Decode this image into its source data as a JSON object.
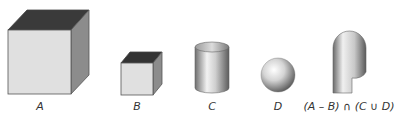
{
  "diagram": {
    "type": "constructive-solid-geometry",
    "shapes": [
      {
        "id": "A",
        "label": "A",
        "kind": "cube",
        "size": "large"
      },
      {
        "id": "B",
        "label": "B",
        "kind": "cube",
        "size": "small"
      },
      {
        "id": "C",
        "label": "C",
        "kind": "cylinder"
      },
      {
        "id": "D",
        "label": "D",
        "kind": "sphere"
      },
      {
        "id": "result",
        "label": "(A – B) ∩ (C ∪ D)",
        "kind": "composite-solid"
      }
    ],
    "colors": {
      "cube_top": "#3a3a3a",
      "cube_front": "#e0e0e0",
      "cube_side": "#8c8c8c",
      "edge": "#555555",
      "label": "#333333"
    }
  }
}
